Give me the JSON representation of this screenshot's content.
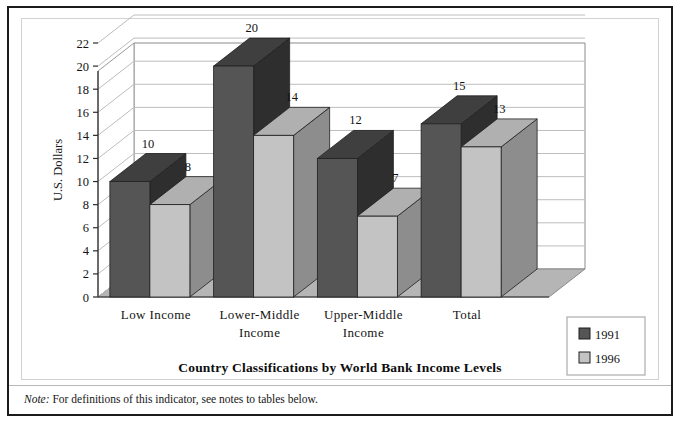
{
  "note": {
    "label": "Note:",
    "text": " For definitions of this indicator, see notes to tables below."
  },
  "chart_data": {
    "type": "bar",
    "title": "",
    "xlabel": "Country Classifications by World Bank Income Levels",
    "ylabel": "U.S. Dollars",
    "categories": [
      "Low Income",
      "Lower-Middle Income",
      "Upper-Middle Income",
      "Total"
    ],
    "category_lines": [
      [
        "Low Income"
      ],
      [
        "Lower-Middle",
        "Income"
      ],
      [
        "Upper-Middle",
        "Income"
      ],
      [
        "Total"
      ]
    ],
    "series": [
      {
        "name": "1991",
        "values": [
          10,
          20,
          12,
          15
        ],
        "color": "#555555"
      },
      {
        "name": "1996",
        "values": [
          8,
          14,
          7,
          13
        ],
        "color": "#c3c3c3"
      }
    ],
    "ylim": [
      0,
      22
    ],
    "yticks": [
      0,
      2,
      4,
      6,
      8,
      10,
      12,
      14,
      16,
      18,
      20,
      22
    ],
    "ytick_labels": [
      "0",
      "2",
      "4",
      "6",
      "8",
      "10",
      "12",
      "14",
      "16",
      "18",
      "20",
      "22"
    ],
    "grid": true,
    "legend_position": "bottom-right",
    "style": "3d-column",
    "colors": {
      "series_1991_front": "#555555",
      "series_1991_top": "#3f3f3f",
      "series_1991_side": "#2e2e2e",
      "series_1996_front": "#c3c3c3",
      "series_1996_top": "#b0b0b0",
      "series_1996_side": "#8d8d8d",
      "floor": "#b5b5b5",
      "wall": "#ffffff",
      "gridline": "#bdbdbd",
      "frame": "#1b1b1b"
    }
  }
}
